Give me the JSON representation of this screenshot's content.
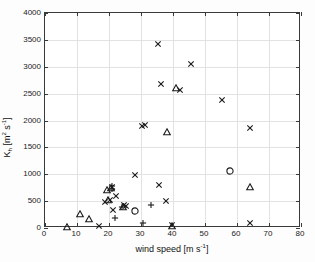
{
  "chart_data": {
    "type": "scatter",
    "title": "",
    "xlabel": "wind speed [m s-1]",
    "xlabel_parts": {
      "text": "wind speed [m s",
      "sup": "-1",
      "tail": "]"
    },
    "ylabel": "K_h [m2 s-1]",
    "ylabel_parts": {
      "lead": "K",
      "sub": "h",
      "mid": " [m",
      "sup1": "2",
      "mid2": " s",
      "sup2": "-1",
      "tail": "]"
    },
    "xlim": [
      0,
      80
    ],
    "ylim": [
      0,
      4000
    ],
    "xticks": [
      0,
      10,
      20,
      30,
      40,
      50,
      60,
      70,
      80
    ],
    "yticks": [
      0,
      500,
      1000,
      1500,
      2000,
      2500,
      3000,
      3500,
      4000
    ],
    "grid": true,
    "legend": null,
    "marker_colors": {
      "cross": "#1a1a1a",
      "triangle": "#1a1a1a",
      "plus": "#1a1a1a",
      "circle": "#1a1a1a"
    },
    "series": [
      {
        "name": "cross-markers",
        "marker": "cross",
        "points": [
          [
            17.0,
            30
          ],
          [
            18.8,
            480
          ],
          [
            20.3,
            530
          ],
          [
            21.0,
            760
          ],
          [
            21.3,
            330
          ],
          [
            22.2,
            600
          ],
          [
            24.6,
            420
          ],
          [
            25.2,
            415
          ],
          [
            28.2,
            980
          ],
          [
            30.2,
            1900
          ],
          [
            31.3,
            1910
          ],
          [
            35.4,
            3430
          ],
          [
            35.7,
            800
          ],
          [
            36.4,
            2670
          ],
          [
            37.8,
            510
          ],
          [
            39.6,
            50
          ],
          [
            42.3,
            2560
          ],
          [
            45.6,
            3060
          ],
          [
            55.3,
            2390
          ],
          [
            64.0,
            1865
          ],
          [
            64.2,
            100
          ]
        ]
      },
      {
        "name": "triangle-markers",
        "marker": "triangle",
        "points": [
          [
            7.0,
            20
          ],
          [
            11.0,
            260
          ],
          [
            13.6,
            170
          ],
          [
            19.3,
            700
          ],
          [
            19.8,
            520
          ],
          [
            20.5,
            745
          ],
          [
            24.4,
            400
          ],
          [
            38.0,
            1790
          ],
          [
            39.7,
            40
          ],
          [
            41.0,
            2600
          ],
          [
            64.1,
            765
          ]
        ]
      },
      {
        "name": "plus-markers",
        "marker": "plus",
        "points": [
          [
            20.9,
            775
          ],
          [
            21.0,
            720
          ],
          [
            22.0,
            195
          ],
          [
            24.0,
            395
          ],
          [
            30.5,
            90
          ],
          [
            33.0,
            430
          ]
        ]
      },
      {
        "name": "open-circle-markers",
        "marker": "circle",
        "points": [
          [
            28.2,
            320
          ],
          [
            57.9,
            1055
          ]
        ]
      }
    ]
  }
}
